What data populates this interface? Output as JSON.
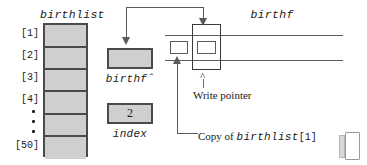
{
  "figure": {
    "title_birthlist": "birthlist",
    "title_birthf": "birthf"
  },
  "array": {
    "name": "birthlist",
    "labels": [
      "[1]",
      "[2]",
      "[3]",
      "[4]",
      "[50]"
    ],
    "ellipsis": "·",
    "cell_count": 6,
    "cells": [
      "",
      "",
      "",
      "",
      "",
      ""
    ]
  },
  "variables": [
    {
      "name": "birthf-pointer-var",
      "label": "birthfˆ",
      "value": ""
    },
    {
      "name": "index-var",
      "label": "index",
      "value": "2"
    }
  ],
  "file": {
    "name": "birthf",
    "label": "birthf",
    "record_value": "",
    "buffered_record_value": ""
  },
  "annotations": {
    "write_pointer": "Write pointer",
    "write_pointer_caret": "^",
    "copy_of": "Copy of ",
    "copy_of_var": "birthlist",
    "copy_of_index": "[1]"
  },
  "colors": {
    "cell_fill": "#cfcfcf",
    "cell_border": "#4a4a4a",
    "line": "#5a5a5a",
    "text": "#1a1a1a",
    "page_background": "#ffffff"
  }
}
